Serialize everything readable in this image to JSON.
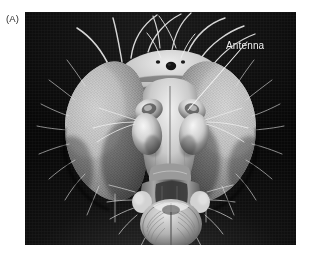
{
  "figure": {
    "panel_label": "(A)",
    "panel_label_color": "#2b2b2b",
    "background_color": "#ffffff",
    "type": "scanning-electron-micrograph"
  },
  "micrograph": {
    "frame": {
      "x": 25,
      "y": 12,
      "width": 271,
      "height": 233
    },
    "background_color": "#101010",
    "tone": "grayscale",
    "description": "Black-and-white scanning electron micrograph of the head of a fruit fly showing two large compound eyes, the ocellar triangle, long arching macrochaetae bristles, paired antennae and the proboscis with labellum."
  },
  "annotations": [
    {
      "id": "antenna",
      "label": "Antenna",
      "label_color": "#f2f2f2",
      "label_position": {
        "x": 201,
        "y": 28
      },
      "leader_line": {
        "color": "#f2f2f2",
        "from": {
          "x": 222,
          "y": 30
        },
        "to": {
          "x": 163,
          "y": 98
        }
      }
    }
  ]
}
